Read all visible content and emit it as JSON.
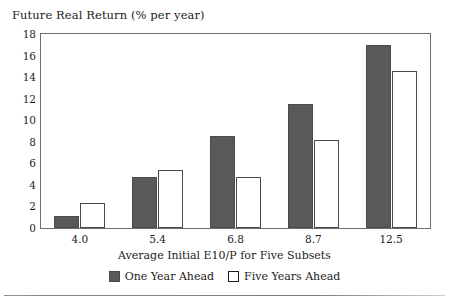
{
  "chart_data": {
    "type": "bar",
    "title": "Future Real Return (% per year)",
    "xlabel": "Average Initial E10/P for Five Subsets",
    "ylabel": "",
    "categories": [
      "4.0",
      "5.4",
      "6.8",
      "8.7",
      "12.5"
    ],
    "series": [
      {
        "name": "One Year Ahead",
        "color": "#595959",
        "values": [
          1.1,
          4.7,
          8.5,
          11.5,
          17.0
        ]
      },
      {
        "name": "Five Years Ahead",
        "color": "#ffffff",
        "values": [
          2.3,
          5.4,
          4.7,
          8.2,
          14.6
        ]
      }
    ],
    "ylim": [
      0,
      18
    ],
    "ytick_step": 2,
    "yticks": [
      "18",
      "16",
      "14",
      "12",
      "10",
      "8",
      "6",
      "4",
      "2",
      "0"
    ],
    "grid": false,
    "legend_position": "bottom"
  },
  "legend": {
    "items": [
      {
        "label": "One Year Ahead",
        "swatch": "filled-dark-swatch"
      },
      {
        "label": "Five Years Ahead",
        "swatch": "open-white-swatch"
      }
    ]
  }
}
